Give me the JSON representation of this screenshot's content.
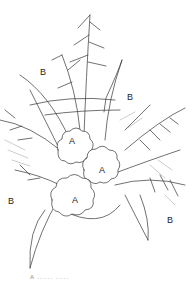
{
  "figure": {
    "type": "botanical line drawing",
    "labels": [
      {
        "id": "B1",
        "text": "B",
        "x": 45,
        "y": 72
      },
      {
        "id": "B2",
        "text": "B",
        "x": 129,
        "y": 92
      },
      {
        "id": "A1",
        "text": "A",
        "x": 70,
        "y": 136
      },
      {
        "id": "A2",
        "text": "A",
        "x": 100,
        "y": 166
      },
      {
        "id": "A3",
        "text": "A",
        "x": 73,
        "y": 197
      },
      {
        "id": "B3",
        "text": "B",
        "x": 8,
        "y": 198
      },
      {
        "id": "B4",
        "text": "B",
        "x": 167,
        "y": 215
      }
    ],
    "caption": "A    ......    ....."
  }
}
